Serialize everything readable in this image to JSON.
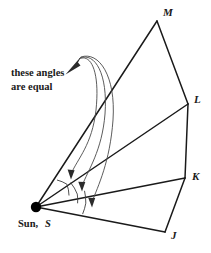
{
  "figure": {
    "width": 211,
    "height": 253,
    "background_color": "#ffffff",
    "line_color": "#1a1a1a",
    "arrow_color": "#4a4a4a",
    "arc_color": "#3c3c3c"
  },
  "caption": {
    "line1": "these angles",
    "line2": "are equal"
  },
  "center": {
    "word": "Sun,",
    "symbol": "S",
    "x": 36,
    "y": 207,
    "dot_radius": 5.2
  },
  "vertices": [
    {
      "id": "M",
      "label": "M",
      "x": 157,
      "y": 21,
      "label_x": 163,
      "label_y": 16
    },
    {
      "id": "L",
      "label": "L",
      "x": 188,
      "y": 104,
      "label_x": 194,
      "label_y": 103
    },
    {
      "id": "K",
      "label": "K",
      "x": 185,
      "y": 178,
      "label_x": 192,
      "label_y": 180
    },
    {
      "id": "J",
      "label": "J",
      "x": 165,
      "y": 232,
      "label_x": 171,
      "label_y": 239
    }
  ],
  "rays": [
    {
      "name": "ray-sun-m",
      "from": "S",
      "to": "M"
    },
    {
      "name": "ray-sun-l",
      "from": "S",
      "to": "L"
    },
    {
      "name": "ray-sun-k",
      "from": "S",
      "to": "K"
    },
    {
      "name": "ray-sun-j",
      "from": "S",
      "to": "J"
    }
  ],
  "chain": [
    {
      "name": "segment-m-l",
      "from": "M",
      "to": "L"
    },
    {
      "name": "segment-l-k",
      "from": "L",
      "to": "K"
    },
    {
      "name": "segment-k-j",
      "from": "K",
      "to": "J"
    }
  ],
  "angle_arcs": [
    {
      "name": "angle-arc-msl",
      "between": [
        "M",
        "L"
      ],
      "radius": 34
    },
    {
      "name": "angle-arc-lsk",
      "between": [
        "L",
        "K"
      ],
      "radius": 42
    },
    {
      "name": "angle-arc-ksj",
      "between": [
        "K",
        "J"
      ],
      "radius": 50
    }
  ],
  "pointer_arrows": [
    {
      "name": "pointer-arrow-1",
      "targets": "angle-arc-msl",
      "tip_x": 71,
      "tip_y": 178
    },
    {
      "name": "pointer-arrow-2",
      "targets": "angle-arc-lsk",
      "tip_x": 82,
      "tip_y": 190
    },
    {
      "name": "pointer-arrow-3",
      "targets": "angle-arc-ksj",
      "tip_x": 92,
      "tip_y": 206
    }
  ],
  "pointer_origin": {
    "x": 76,
    "y": 58
  }
}
